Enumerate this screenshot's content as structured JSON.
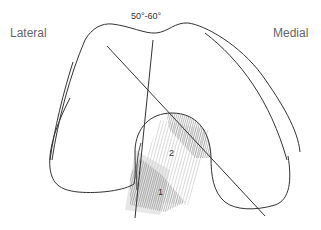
{
  "labels": {
    "lateral": "Lateral",
    "medial": "Medial",
    "angle": "50°-60°"
  },
  "regions": [
    {
      "id": "1",
      "label": "1"
    },
    {
      "id": "2",
      "label": "2"
    }
  ],
  "colors": {
    "outline": "#333333",
    "text": "#666666",
    "hatch": "#9a9a9a",
    "shade_dark": "#7a7a7a"
  }
}
